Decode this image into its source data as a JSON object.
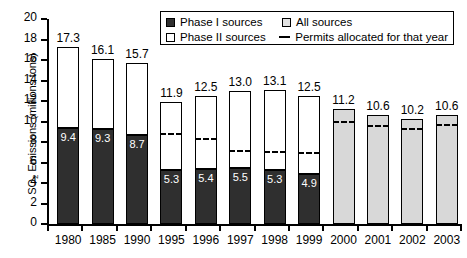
{
  "chart_data": {
    "type": "bar",
    "title": "",
    "xlabel": "",
    "ylabel": "SO2 Emissions (millions tons)",
    "ylabel_main": "SO",
    "ylabel_sub": "2",
    "ylabel_rest": " Emissions (millions tons)",
    "ylim": [
      0,
      20
    ],
    "yticks": [
      0,
      2,
      4,
      6,
      8,
      10,
      12,
      14,
      16,
      18,
      20
    ],
    "grid": false,
    "legend_position": "top-right",
    "categories": [
      "1980",
      "1985",
      "1990",
      "1995",
      "1996",
      "1997",
      "1998",
      "1999",
      "2000",
      "2001",
      "2002",
      "2003"
    ],
    "series": [
      {
        "name": "Phase I sources",
        "values": [
          9.4,
          9.3,
          8.7,
          5.3,
          5.4,
          5.5,
          5.3,
          4.9,
          null,
          null,
          null,
          null
        ]
      },
      {
        "name": "Phase II sources",
        "values": [
          7.9,
          6.8,
          7.0,
          6.6,
          7.1,
          7.5,
          7.8,
          7.6,
          null,
          null,
          null,
          null
        ]
      },
      {
        "name": "All sources",
        "values": [
          null,
          null,
          null,
          null,
          null,
          null,
          null,
          null,
          11.2,
          10.6,
          10.2,
          10.6
        ]
      },
      {
        "name": "Permits allocated for that year",
        "values": [
          null,
          null,
          null,
          8.7,
          8.2,
          7.0,
          6.9,
          6.8,
          9.9,
          9.5,
          9.2,
          9.6
        ]
      }
    ],
    "totals": [
      17.3,
      16.1,
      15.7,
      11.9,
      12.5,
      13.0,
      13.1,
      12.5,
      11.2,
      10.6,
      10.2,
      10.6
    ],
    "total_labels": [
      "17.3",
      "16.1",
      "15.7",
      "11.9",
      "12.5",
      "13.0",
      "13.1",
      "12.5",
      "11.2",
      "10.6",
      "10.2",
      "10.6"
    ],
    "phase1_labels": [
      "9.4",
      "9.3",
      "8.7",
      "5.3",
      "5.4",
      "5.5",
      "5.3",
      "4.9",
      "",
      "",
      "",
      ""
    ],
    "colors": {
      "phase1": "#2f2f2f",
      "phase2": "#ffffff",
      "all": "#d8d8d8",
      "axis": "#000000"
    }
  },
  "legend": {
    "items": [
      {
        "label": "Phase I sources",
        "marker": "filled-square"
      },
      {
        "label": "All sources",
        "marker": "light-square"
      },
      {
        "label": "Phase II sources",
        "marker": "empty-square"
      },
      {
        "label": "Permits allocated for that year",
        "marker": "dashed-line"
      }
    ]
  }
}
